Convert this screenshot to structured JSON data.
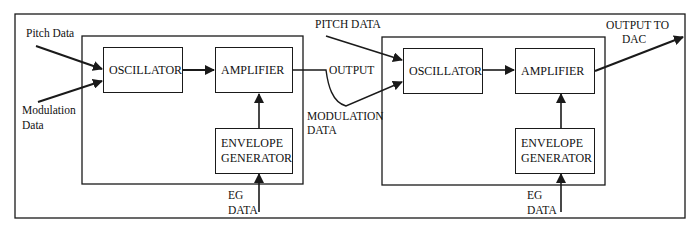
{
  "diagram": {
    "type": "block-diagram",
    "title": "",
    "outer_frame": true,
    "modules": [
      {
        "id": "module-1",
        "blocks": {
          "oscillator": "OSCILLATOR",
          "amplifier": "AMPLIFIER",
          "envelope_line1": "ENVELOPE",
          "envelope_line2": "GENERATOR"
        },
        "inputs": {
          "pitch": "Pitch Data",
          "modulation_line1": "Modulation",
          "modulation_line2": "Data",
          "eg_line1": "EG",
          "eg_line2": "DATA"
        },
        "output": "OUTPUT"
      },
      {
        "id": "module-2",
        "blocks": {
          "oscillator": "OSCILLATOR",
          "amplifier": "AMPLIFIER",
          "envelope_line1": "ENVELOPE",
          "envelope_line2": "GENERATOR"
        },
        "inputs": {
          "pitch": "PITCH DATA",
          "modulation_line1": "MODULATION",
          "modulation_line2": "DATA",
          "eg_line1": "EG",
          "eg_line2": "DATA"
        },
        "output_line1": "OUTPUT TO",
        "output_line2": "DAC"
      }
    ],
    "connections": [
      {
        "from": "Pitch Data",
        "to": "module-1.oscillator"
      },
      {
        "from": "Modulation Data",
        "to": "module-1.oscillator"
      },
      {
        "from": "module-1.oscillator",
        "to": "module-1.amplifier"
      },
      {
        "from": "module-1.envelope_generator",
        "to": "module-1.amplifier"
      },
      {
        "from": "EG DATA",
        "to": "module-1.envelope_generator"
      },
      {
        "from": "module-1.amplifier",
        "to": "module-2.oscillator",
        "label": "OUTPUT / MODULATION DATA"
      },
      {
        "from": "PITCH DATA",
        "to": "module-2.oscillator"
      },
      {
        "from": "module-2.oscillator",
        "to": "module-2.amplifier"
      },
      {
        "from": "module-2.envelope_generator",
        "to": "module-2.amplifier"
      },
      {
        "from": "EG DATA",
        "to": "module-2.envelope_generator"
      },
      {
        "from": "module-2.amplifier",
        "to": "OUTPUT TO DAC"
      }
    ],
    "colors": {
      "line": "#1a1a1a",
      "background": "#ffffff"
    }
  }
}
